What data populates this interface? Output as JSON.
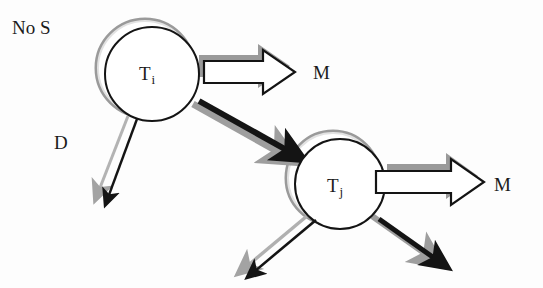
{
  "diagram": {
    "title": "No S",
    "background_color": "#fdfdfd",
    "ink_color": "#1b1b1b",
    "shadow_color": "#9a9a9a",
    "shadow_light_color": "#d9d9d9",
    "labels": {
      "top_left": "No S",
      "decay": "D",
      "migration_1": "M",
      "migration_2": "M"
    },
    "nodes": [
      {
        "id": "ti",
        "label": "T",
        "subscript": "i",
        "cx": 152,
        "cy": 74,
        "r": 47
      },
      {
        "id": "tj",
        "label": "T",
        "subscript": "j",
        "cx": 340,
        "cy": 184,
        "r": 45
      }
    ],
    "edges": [
      {
        "id": "ti-to-tj",
        "from": "ti",
        "to": "tj",
        "style": "thick-arrow",
        "label": ""
      },
      {
        "id": "ti-decay",
        "from": "ti",
        "to": "",
        "style": "thin-arrow",
        "label": "D"
      },
      {
        "id": "ti-migration",
        "from": "ti",
        "to": "",
        "style": "block-arrow",
        "label": "M"
      },
      {
        "id": "tj-out-left",
        "from": "tj",
        "to": "",
        "style": "thin-arrow",
        "label": ""
      },
      {
        "id": "tj-out-right",
        "from": "tj",
        "to": "",
        "style": "thick-arrow",
        "label": ""
      },
      {
        "id": "tj-migration",
        "from": "tj",
        "to": "",
        "style": "block-arrow",
        "label": "M"
      }
    ]
  }
}
